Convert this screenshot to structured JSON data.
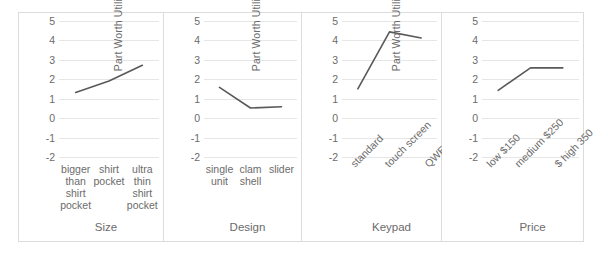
{
  "figure": {
    "ylabel": "Part Worth Utility",
    "yticks": [
      "5",
      "4",
      "3",
      "2",
      "1",
      "0",
      "-1",
      "-2"
    ],
    "line_color": "#595959",
    "grid_color": "#e6e6e6",
    "border_color": "#dcdcdc",
    "text_color": "#6b6b6b"
  },
  "chart_data": [
    {
      "type": "line",
      "title": "",
      "xlabel": "Size",
      "ylabel": "Part Worth Utility",
      "categories": [
        "bigger\nthan\nshirt\npocket",
        "shirt\npocket",
        "ultra\nthin\nshirt\npocket"
      ],
      "values": [
        0.0,
        0.8,
        1.9
      ],
      "ylim": [
        -2,
        5
      ],
      "grid": true,
      "legend": "none",
      "label_rotation": 0
    },
    {
      "type": "line",
      "title": "",
      "xlabel": "Design",
      "ylabel": "Part Worth Utility",
      "categories": [
        "single\nunit",
        "clam\nshell",
        "slider"
      ],
      "values": [
        0.0,
        -1.55,
        -1.45
      ],
      "ylim": [
        -2,
        5
      ],
      "grid": true,
      "legend": "none",
      "label_rotation": 0
    },
    {
      "type": "line",
      "title": "",
      "xlabel": "Keypad",
      "ylabel": "Part Worth Utility",
      "categories": [
        "standard",
        "touch screen",
        "QWERTY"
      ],
      "values": [
        0.0,
        4.2,
        3.75
      ],
      "ylim": [
        -2,
        5
      ],
      "grid": true,
      "legend": "none",
      "label_rotation": -45
    },
    {
      "type": "line",
      "title": "",
      "xlabel": "Price",
      "ylabel": "Part Worth Utility",
      "categories": [
        "low $150",
        "medium $250",
        "$ high 350"
      ],
      "values": [
        0.0,
        1.62,
        1.62
      ],
      "ylim": [
        -2,
        5
      ],
      "grid": true,
      "legend": "none",
      "label_rotation": -45
    }
  ]
}
